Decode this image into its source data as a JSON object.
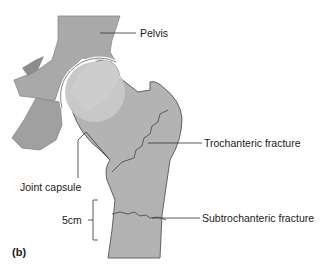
{
  "figure": {
    "panel_label": "(b)",
    "labels": {
      "pelvis": "Pelvis",
      "trochanteric_fracture": "Trochanteric fracture",
      "joint_capsule": "Joint capsule",
      "scale": "5cm",
      "subtrochanteric_fracture": "Subtrochanteric fracture"
    },
    "colors": {
      "bone": "#a9a9a9",
      "bone_light": "#c8c8c8",
      "bone_dark": "#8c8c8c",
      "outline": "#555555",
      "fracture_line": "#5a5a5a",
      "leader_line": "#333333"
    }
  }
}
